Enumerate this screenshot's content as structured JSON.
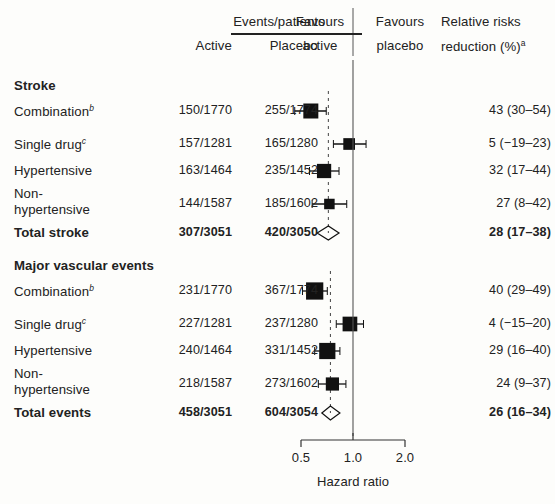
{
  "figure": {
    "type": "forest-plot",
    "headers": {
      "events_patients": "Events/patients",
      "active": "Active",
      "placebo": "Placebo",
      "favours_active_l1": "Favours",
      "favours_active_l2": "active",
      "favours_placebo_l1": "Favours",
      "favours_placebo_l2": "placebo",
      "rrr_l1": "Relative risks",
      "rrr_l2": "reduction (%)",
      "rrr_sup": "a"
    },
    "axis": {
      "label": "Hazard ratio",
      "ticks": [
        "0.5",
        "1.0",
        "2.0"
      ],
      "tick_values": [
        0.5,
        1.0,
        2.0
      ],
      "scale": "log",
      "reference_line": 1.0
    },
    "sections": [
      {
        "title": "Stroke",
        "total_dashed_hr": 0.72,
        "rows": [
          {
            "label": "Combination",
            "sup": "b",
            "active": "150/1770",
            "placebo": "255/1774",
            "rrr": "43 (30–54)",
            "hr": 0.57,
            "lo": 0.46,
            "hi": 0.7,
            "weight": 1.0,
            "bold": false,
            "diamond": false
          },
          {
            "label": "Single drug",
            "sup": "c",
            "active": "157/1281",
            "placebo": "165/1280",
            "rrr": "5 (−19–23)",
            "hr": 0.95,
            "lo": 0.77,
            "hi": 1.19,
            "weight": 0.78,
            "bold": false,
            "diamond": false
          },
          {
            "label": "Hypertensive",
            "sup": "",
            "active": "163/1464",
            "placebo": "235/1452",
            "rrr": "32 (17–44)",
            "hr": 0.68,
            "lo": 0.56,
            "hi": 0.83,
            "weight": 0.95,
            "bold": false,
            "diamond": false
          },
          {
            "label": "Non-hypertensive",
            "sup": "",
            "active": "144/1587",
            "placebo": "185/1602",
            "rrr": "27 (8–42)",
            "hr": 0.73,
            "lo": 0.58,
            "hi": 0.92,
            "weight": 0.7,
            "bold": false,
            "diamond": false
          },
          {
            "label": "Total stroke",
            "sup": "",
            "active": "307/3051",
            "placebo": "420/3050",
            "rrr": "28 (17–38)",
            "hr": 0.72,
            "lo": 0.62,
            "hi": 0.83,
            "weight": 1.0,
            "bold": true,
            "diamond": true
          }
        ]
      },
      {
        "title": "Major vascular events",
        "total_dashed_hr": 0.74,
        "rows": [
          {
            "label": "Combination",
            "sup": "b",
            "active": "231/1770",
            "placebo": "367/1774",
            "rrr": "40 (29–49)",
            "hr": 0.6,
            "lo": 0.51,
            "hi": 0.71,
            "weight": 1.15,
            "bold": false,
            "diamond": false
          },
          {
            "label": "Single drug",
            "sup": "c",
            "active": "227/1281",
            "placebo": "237/1280",
            "rrr": "4 (−15–20)",
            "hr": 0.96,
            "lo": 0.8,
            "hi": 1.15,
            "weight": 0.98,
            "bold": false,
            "diamond": false
          },
          {
            "label": "Hypertensive",
            "sup": "",
            "active": "240/1464",
            "placebo": "331/1452",
            "rrr": "29 (16–40)",
            "hr": 0.71,
            "lo": 0.6,
            "hi": 0.84,
            "weight": 1.08,
            "bold": false,
            "diamond": false
          },
          {
            "label": "Non-hypertensive",
            "sup": "",
            "active": "218/1587",
            "placebo": "273/1602",
            "rrr": "24 (9–37)",
            "hr": 0.76,
            "lo": 0.63,
            "hi": 0.91,
            "weight": 0.88,
            "bold": false,
            "diamond": false
          },
          {
            "label": "Total events",
            "sup": "",
            "active": "458/3051",
            "placebo": "604/3054",
            "rrr": "26 (16–34)",
            "hr": 0.74,
            "lo": 0.66,
            "hi": 0.84,
            "weight": 1.0,
            "bold": true,
            "diamond": true
          }
        ]
      }
    ]
  },
  "chart_data": {
    "type": "scatter",
    "title": "",
    "xlabel": "Hazard ratio",
    "ylabel": "",
    "xlim": [
      0.5,
      2.0
    ],
    "xscale": "log",
    "xticks": [
      0.5,
      1.0,
      2.0
    ],
    "xticklabels": [
      "0.5",
      "1.0",
      "2.0"
    ],
    "grid": false,
    "legend": null,
    "reference_line": 1.0,
    "series": [
      {
        "name": "Stroke",
        "points": [
          {
            "label": "Combination",
            "active_events": 150,
            "active_total": 1770,
            "placebo_events": 255,
            "placebo_total": 1774,
            "hr": 0.57,
            "ci": [
              0.46,
              0.7
            ],
            "rrr_pct": 43,
            "rrr_ci": [
              30,
              54
            ]
          },
          {
            "label": "Single drug",
            "active_events": 157,
            "active_total": 1281,
            "placebo_events": 165,
            "placebo_total": 1280,
            "hr": 0.95,
            "ci": [
              0.77,
              1.19
            ],
            "rrr_pct": 5,
            "rrr_ci": [
              -19,
              23
            ]
          },
          {
            "label": "Hypertensive",
            "active_events": 163,
            "active_total": 1464,
            "placebo_events": 235,
            "placebo_total": 1452,
            "hr": 0.68,
            "ci": [
              0.56,
              0.83
            ],
            "rrr_pct": 32,
            "rrr_ci": [
              17,
              44
            ]
          },
          {
            "label": "Non-hypertensive",
            "active_events": 144,
            "active_total": 1587,
            "placebo_events": 185,
            "placebo_total": 1602,
            "hr": 0.73,
            "ci": [
              0.58,
              0.92
            ],
            "rrr_pct": 27,
            "rrr_ci": [
              8,
              42
            ]
          },
          {
            "label": "Total stroke",
            "active_events": 307,
            "active_total": 3051,
            "placebo_events": 420,
            "placebo_total": 3050,
            "hr": 0.72,
            "ci": [
              0.62,
              0.83
            ],
            "rrr_pct": 28,
            "rrr_ci": [
              17,
              38
            ]
          }
        ]
      },
      {
        "name": "Major vascular events",
        "points": [
          {
            "label": "Combination",
            "active_events": 231,
            "active_total": 1770,
            "placebo_events": 367,
            "placebo_total": 1774,
            "hr": 0.6,
            "ci": [
              0.51,
              0.71
            ],
            "rrr_pct": 40,
            "rrr_ci": [
              29,
              49
            ]
          },
          {
            "label": "Single drug",
            "active_events": 227,
            "active_total": 1281,
            "placebo_events": 237,
            "placebo_total": 1280,
            "hr": 0.96,
            "ci": [
              0.8,
              1.15
            ],
            "rrr_pct": 4,
            "rrr_ci": [
              -15,
              20
            ]
          },
          {
            "label": "Hypertensive",
            "active_events": 240,
            "active_total": 1464,
            "placebo_events": 331,
            "placebo_total": 1452,
            "hr": 0.71,
            "ci": [
              0.6,
              0.84
            ],
            "rrr_pct": 29,
            "rrr_ci": [
              16,
              40
            ]
          },
          {
            "label": "Non-hypertensive",
            "active_events": 218,
            "active_total": 1587,
            "placebo_events": 273,
            "placebo_total": 1602,
            "hr": 0.76,
            "ci": [
              0.63,
              0.91
            ],
            "rrr_pct": 24,
            "rrr_ci": [
              9,
              37
            ]
          },
          {
            "label": "Total events",
            "active_events": 458,
            "active_total": 3051,
            "placebo_events": 604,
            "placebo_total": 3054,
            "hr": 0.74,
            "ci": [
              0.66,
              0.84
            ],
            "rrr_pct": 26,
            "rrr_ci": [
              16,
              34
            ]
          }
        ]
      }
    ]
  }
}
